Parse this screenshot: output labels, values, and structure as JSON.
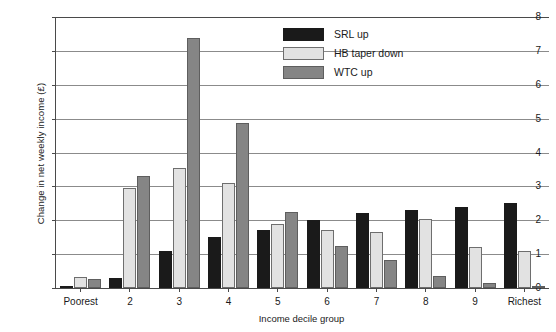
{
  "caption_remnant": "",
  "chart_data": {
    "type": "bar",
    "title": "",
    "xlabel": "Income decile group",
    "ylabel": "Change in net weekly income (£)",
    "categories": [
      "Poorest",
      "2",
      "3",
      "4",
      "5",
      "6",
      "7",
      "8",
      "9",
      "Richest"
    ],
    "series": [
      {
        "name": "SRL up",
        "color": "#1a1a1a",
        "values": [
          0.04,
          0.3,
          1.1,
          1.5,
          1.72,
          2.0,
          2.2,
          2.3,
          2.4,
          2.5
        ]
      },
      {
        "name": "HB taper down",
        "color": "#e2e2e2",
        "values": [
          0.32,
          2.95,
          3.55,
          3.1,
          1.9,
          1.7,
          1.65,
          2.05,
          1.2,
          1.1
        ]
      },
      {
        "name": "WTC up",
        "color": "#858585",
        "values": [
          0.27,
          3.32,
          7.38,
          4.88,
          2.25,
          1.25,
          0.82,
          0.35,
          0.15,
          0.05
        ]
      }
    ],
    "ylim": [
      0,
      8
    ],
    "yticks": [
      0,
      1,
      2,
      3,
      4,
      5,
      6,
      7,
      8
    ],
    "ytick_labels": [
      "0",
      "1",
      "2",
      "3",
      "4",
      "5",
      "6",
      "7",
      "8"
    ],
    "grid": true,
    "legend_position": "upper-center"
  }
}
